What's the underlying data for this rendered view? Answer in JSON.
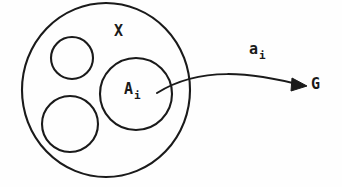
{
  "figure": {
    "type": "set-theory-diagram",
    "background_color": "#fefefe",
    "stroke_color": "#1a1a1a"
  },
  "shapes": {
    "outer_circle": {
      "name": "X",
      "cx": 106,
      "cy": 90,
      "rx": 84,
      "ry": 87
    },
    "inner_circles": [
      {
        "name": "upper-left-subset",
        "cx": 72,
        "cy": 58,
        "r": 21
      },
      {
        "name": "lower-left-subset",
        "cx": 70,
        "cy": 124,
        "r": 28
      },
      {
        "name": "Ai-subset",
        "cx": 136,
        "cy": 94,
        "r": 36
      }
    ]
  },
  "arrow": {
    "name": "map-arrow",
    "from": "A_i",
    "to": "G",
    "start": {
      "x": 157,
      "y": 93
    },
    "control1": {
      "x": 205,
      "y": 68
    },
    "control2": {
      "x": 255,
      "y": 74
    },
    "end": {
      "x": 306,
      "y": 86
    }
  },
  "labels": {
    "set_X": {
      "base": "X",
      "sub": ""
    },
    "subset_Ai": {
      "base": "A",
      "sub": "i"
    },
    "map_ai": {
      "base": "a",
      "sub": "i"
    },
    "group_G": {
      "base": "G",
      "sub": ""
    }
  }
}
